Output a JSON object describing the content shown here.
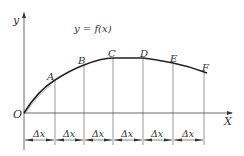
{
  "diagram": {
    "function_label": "y = f(x)",
    "axes": {
      "y_label": "y",
      "x_label": "X",
      "origin_label": "O"
    },
    "points": [
      {
        "label": "A",
        "x": 55,
        "y": 80,
        "lx": 47,
        "ly": 77
      },
      {
        "label": "B",
        "x": 84,
        "y": 65,
        "lx": 78,
        "ly": 62
      },
      {
        "label": "C",
        "x": 113,
        "y": 58,
        "lx": 108,
        "ly": 55
      },
      {
        "label": "D",
        "x": 143,
        "y": 58,
        "lx": 140,
        "ly": 55
      },
      {
        "label": "E",
        "x": 173,
        "y": 63,
        "lx": 170,
        "ly": 60
      },
      {
        "label": "F",
        "x": 204,
        "y": 71,
        "lx": 203,
        "ly": 68
      }
    ],
    "interval_label": "Δx",
    "interval_count": 6,
    "colors": {
      "curve": "#222222",
      "lines": "#555555",
      "text": "#333333"
    }
  }
}
